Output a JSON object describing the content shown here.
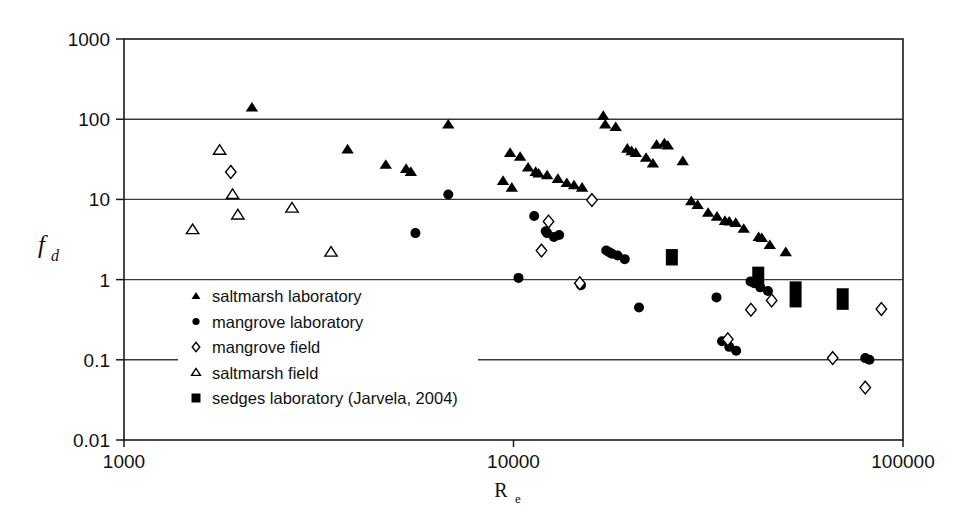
{
  "figure": {
    "background_color": "#ffffff",
    "ink_color": "#000000"
  },
  "chart_data": {
    "type": "scatter",
    "title": "",
    "xlabel": "R_e",
    "xlabel_base": "R",
    "xlabel_sub": "e",
    "ylabel": "f_d",
    "ylabel_base": "f",
    "ylabel_sub": "d",
    "xscale": "log",
    "yscale": "log",
    "xlim": [
      1000,
      100000
    ],
    "ylim": [
      0.01,
      1000
    ],
    "xticks": [
      1000,
      10000,
      100000
    ],
    "xtick_labels": [
      "1000",
      "10000",
      "100000"
    ],
    "yticks": [
      0.01,
      0.1,
      1,
      10,
      100,
      1000
    ],
    "ytick_labels": [
      "0.01",
      "0.1",
      "1",
      "10",
      "100",
      "1000"
    ],
    "grid": "horizontal",
    "legend_position": "lower-left-inside",
    "series": [
      {
        "name": "saltmarsh laboratory",
        "marker": "filled-triangle",
        "color": "#000000",
        "points": [
          [
            2130,
            140
          ],
          [
            3750,
            42
          ],
          [
            4700,
            27
          ],
          [
            5300,
            24
          ],
          [
            5450,
            22
          ],
          [
            6800,
            86
          ],
          [
            9800,
            38
          ],
          [
            9400,
            17
          ],
          [
            9900,
            14
          ],
          [
            10400,
            34
          ],
          [
            10900,
            25
          ],
          [
            11400,
            22
          ],
          [
            11600,
            21
          ],
          [
            12200,
            20
          ],
          [
            13000,
            18
          ],
          [
            13700,
            16
          ],
          [
            14300,
            15
          ],
          [
            15000,
            14
          ],
          [
            17000,
            110
          ],
          [
            17200,
            86
          ],
          [
            18300,
            80
          ],
          [
            19600,
            43
          ],
          [
            20100,
            40
          ],
          [
            20600,
            38
          ],
          [
            21900,
            33
          ],
          [
            23300,
            48
          ],
          [
            24400,
            50
          ],
          [
            24900,
            47
          ],
          [
            22800,
            28
          ],
          [
            27200,
            30
          ],
          [
            28600,
            9.5
          ],
          [
            29700,
            8.5
          ],
          [
            31600,
            6.8
          ],
          [
            33300,
            6.1
          ],
          [
            34900,
            5.4
          ],
          [
            35800,
            5.3
          ],
          [
            37200,
            5.1
          ],
          [
            39000,
            4.3
          ],
          [
            42600,
            3.4
          ],
          [
            43400,
            3.3
          ],
          [
            45500,
            2.7
          ],
          [
            50000,
            2.2
          ]
        ]
      },
      {
        "name": "mangrove laboratory",
        "marker": "filled-circle",
        "color": "#000000",
        "points": [
          [
            5600,
            3.8
          ],
          [
            6800,
            11.5
          ],
          [
            10300,
            1.05
          ],
          [
            11300,
            6.2
          ],
          [
            12100,
            4.0
          ],
          [
            12200,
            3.8
          ],
          [
            12700,
            3.4
          ],
          [
            13100,
            3.6
          ],
          [
            14900,
            0.85
          ],
          [
            17300,
            2.3
          ],
          [
            17600,
            2.2
          ],
          [
            17900,
            2.1
          ],
          [
            18500,
            2.0
          ],
          [
            19300,
            1.8
          ],
          [
            21000,
            0.45
          ],
          [
            33200,
            0.6
          ],
          [
            34300,
            0.17
          ],
          [
            35800,
            0.145
          ],
          [
            37300,
            0.13
          ],
          [
            40600,
            0.95
          ],
          [
            41500,
            0.9
          ],
          [
            43000,
            0.8
          ],
          [
            45000,
            0.72
          ],
          [
            80000,
            0.105
          ],
          [
            82000,
            0.1
          ]
        ]
      },
      {
        "name": "mangrove field",
        "marker": "open-diamond",
        "color": "#000000",
        "points": [
          [
            1880,
            22
          ],
          [
            15900,
            9.8
          ],
          [
            12300,
            5.3
          ],
          [
            11800,
            2.3
          ],
          [
            14800,
            0.9
          ],
          [
            35500,
            0.18
          ],
          [
            40700,
            0.42
          ],
          [
            46000,
            0.55
          ],
          [
            66000,
            0.105
          ],
          [
            88000,
            0.43
          ],
          [
            80000,
            0.045
          ]
        ]
      },
      {
        "name": "saltmarsh field",
        "marker": "open-triangle",
        "color": "#000000",
        "points": [
          [
            1500,
            4.2
          ],
          [
            1760,
            41
          ],
          [
            1900,
            11.5
          ],
          [
            1960,
            6.4
          ],
          [
            2700,
            7.8
          ],
          [
            3400,
            2.2
          ]
        ]
      },
      {
        "name": "sedges laboratory (Jarvela, 2004)",
        "marker": "filled-bar",
        "color": "#000000",
        "bars": [
          {
            "x": 25500,
            "ylow": 1.5,
            "yhigh": 2.4
          },
          {
            "x": 42500,
            "ylow": 0.82,
            "yhigh": 1.45
          },
          {
            "x": 53000,
            "ylow": 0.45,
            "yhigh": 0.95
          },
          {
            "x": 70000,
            "ylow": 0.42,
            "yhigh": 0.78
          }
        ]
      }
    ]
  },
  "legend": {
    "items": [
      {
        "marker": "filled-triangle",
        "label": "saltmarsh laboratory"
      },
      {
        "marker": "filled-circle",
        "label": "mangrove laboratory"
      },
      {
        "marker": "open-diamond",
        "label": "mangrove field"
      },
      {
        "marker": "open-triangle",
        "label": "saltmarsh field"
      },
      {
        "marker": "filled-bar",
        "label": "sedges laboratory (Jarvela, 2004)"
      }
    ]
  }
}
